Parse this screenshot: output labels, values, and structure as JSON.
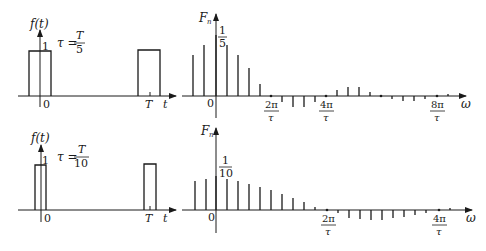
{
  "figure": {
    "rows": [
      {
        "time": {
          "ylabel": "f(t)",
          "xlabel": "t",
          "amp_label": "1",
          "origin_label": "0",
          "period_label": "T",
          "tau_lhs": "τ =",
          "tau_num": "T",
          "tau_den": "5"
        },
        "spectrum": {
          "ylabel": "F",
          "ylabel_sub": "n",
          "xlabel": "ω",
          "origin_label": "0",
          "peak_num": "1",
          "peak_den": "5",
          "ticks": [
            {
              "num": "2π",
              "den": "τ"
            },
            {
              "num": "4π",
              "den": "τ"
            },
            {
              "num": "8π",
              "den": "τ"
            }
          ]
        }
      },
      {
        "time": {
          "ylabel": "f(t)",
          "xlabel": "t",
          "amp_label": "1",
          "origin_label": "0",
          "period_label": "T",
          "tau_lhs": "τ =",
          "tau_num": "T",
          "tau_den": "10"
        },
        "spectrum": {
          "ylabel": "F",
          "ylabel_sub": "n",
          "xlabel": "ω",
          "origin_label": "0",
          "peak_num": "1",
          "peak_den": "10",
          "ticks": [
            {
              "num": "2π",
              "den": "τ"
            },
            {
              "num": "4π",
              "den": "τ"
            }
          ]
        }
      }
    ]
  }
}
